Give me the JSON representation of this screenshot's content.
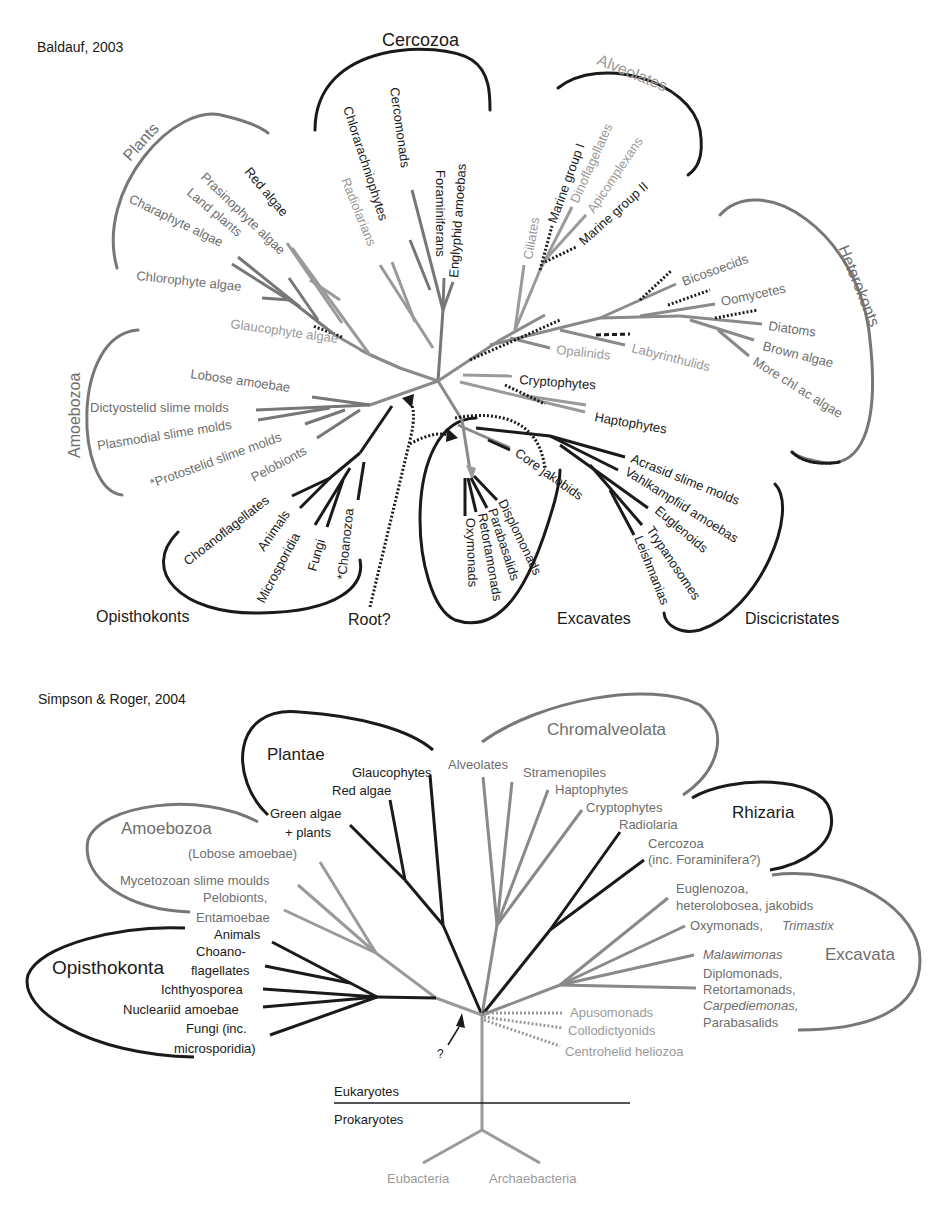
{
  "colors": {
    "dark": "#1a1a1a",
    "mid": "#6e6e6e",
    "light": "#9a9a9a"
  },
  "top_tree": {
    "title": "Baldauf, 2003",
    "groups": [
      {
        "label": "Cercozoa",
        "x": 382,
        "y": 46,
        "size": 18,
        "tone": "dark",
        "rot": 0
      },
      {
        "label": "Alveolates",
        "x": 596,
        "y": 64,
        "size": 16,
        "tone": "light",
        "rot": 22
      },
      {
        "label": "Plants",
        "x": 148,
        "y": 146,
        "size": 16,
        "tone": "mid",
        "rot": -48
      },
      {
        "label": "Heterokonts",
        "x": 846,
        "y": 280,
        "size": 16,
        "tone": "mid",
        "rot": 68
      },
      {
        "label": "Amoebozoa",
        "x": 74,
        "y": 402,
        "size": 16,
        "tone": "mid",
        "rot": -90
      },
      {
        "label": "Opisthokonts",
        "x": 96,
        "y": 622,
        "size": 16,
        "tone": "dark",
        "rot": 0
      },
      {
        "label": "Root?",
        "x": 348,
        "y": 625,
        "size": 16,
        "tone": "dark",
        "rot": 0
      },
      {
        "label": "Excavates",
        "x": 557,
        "y": 624,
        "size": 16,
        "tone": "dark",
        "rot": 0
      },
      {
        "label": "Discicristates",
        "x": 745,
        "y": 624,
        "size": 16,
        "tone": "dark",
        "rot": 0
      }
    ],
    "taxa": [
      {
        "label": "Chlorarachniophytes",
        "x": 342,
        "y": 108,
        "tone": "dark",
        "rot": 72
      },
      {
        "label": "Cercomonads",
        "x": 388,
        "y": 88,
        "tone": "dark",
        "rot": 82
      },
      {
        "label": "Foraminiferans",
        "x": 438,
        "y": 170,
        "tone": "dark",
        "rot": 90
      },
      {
        "label": "Englyphid amoebas",
        "x": 458,
        "y": 245,
        "tone": "dark",
        "rot": -90
      },
      {
        "label": "Radiolarians",
        "x": 340,
        "y": 180,
        "tone": "light",
        "rot": 70
      },
      {
        "label": "Red algae",
        "x": 244,
        "y": 170,
        "tone": "dark",
        "rot": 50
      },
      {
        "label": "Prasinophyte algae",
        "x": 200,
        "y": 176,
        "tone": "mid",
        "rot": 43
      },
      {
        "label": "Land plants",
        "x": 185,
        "y": 192,
        "tone": "mid",
        "rot": 38
      },
      {
        "label": "Charaphyte algae",
        "x": 128,
        "y": 200,
        "tone": "mid",
        "rot": 26
      },
      {
        "label": "Chlorophyte algae",
        "x": 136,
        "y": 280,
        "tone": "mid",
        "rot": 5
      },
      {
        "label": "Glaucophyte algae",
        "x": 231,
        "y": 328,
        "tone": "light",
        "rot": 8
      },
      {
        "label": "Ciliates",
        "x": 532,
        "y": 258,
        "tone": "light",
        "rot": -80
      },
      {
        "label": "Marine group I",
        "x": 558,
        "y": 224,
        "tone": "dark",
        "rot": -70
      },
      {
        "label": "Dinoflagellates",
        "x": 582,
        "y": 205,
        "tone": "light",
        "rot": -65
      },
      {
        "label": "Apicomplexans",
        "x": 594,
        "y": 215,
        "tone": "light",
        "rot": -55
      },
      {
        "label": "Marine group II",
        "x": 582,
        "y": 246,
        "tone": "dark",
        "rot": -42
      },
      {
        "label": "Bicosoecids",
        "x": 682,
        "y": 286,
        "tone": "mid",
        "rot": -20
      },
      {
        "label": "Oomycetes",
        "x": 723,
        "y": 306,
        "tone": "mid",
        "rot": -12
      },
      {
        "label": "Diatoms",
        "x": 767,
        "y": 330,
        "tone": "mid",
        "rot": 8
      },
      {
        "label": "Brown algae",
        "x": 762,
        "y": 350,
        "tone": "mid",
        "rot": 14
      },
      {
        "label": "More chl ac algae",
        "x": 752,
        "y": 364,
        "tone": "mid",
        "rot": 32
      },
      {
        "label": "Opalinids",
        "x": 556,
        "y": 354,
        "tone": "light",
        "rot": 6
      },
      {
        "label": "Labyrinthulids",
        "x": 631,
        "y": 352,
        "tone": "light",
        "rot": 14
      },
      {
        "label": "Cryptophytes",
        "x": 519,
        "y": 384,
        "tone": "dark",
        "rot": 4
      },
      {
        "label": "Haptophytes",
        "x": 594,
        "y": 421,
        "tone": "dark",
        "rot": 10
      },
      {
        "label": "Lobose amoebae",
        "x": 190,
        "y": 378,
        "tone": "mid",
        "rot": 8
      },
      {
        "label": "Dictyostelid slime molds",
        "x": 90,
        "y": 412,
        "tone": "mid",
        "rot": 0
      },
      {
        "label": "Plasmodial slime molds",
        "x": 98,
        "y": 448,
        "tone": "mid",
        "rot": -9
      },
      {
        "label": "*Protostelid slime molds",
        "x": 152,
        "y": 486,
        "tone": "mid",
        "rot": -20
      },
      {
        "label": "Pelobionts",
        "x": 252,
        "y": 480,
        "tone": "mid",
        "rot": -28
      },
      {
        "label": "Core jakobids",
        "x": 514,
        "y": 465,
        "tone": "dark",
        "rot": 35
      },
      {
        "label": "Acrasid slime molds",
        "x": 630,
        "y": 462,
        "tone": "dark",
        "rot": 22
      },
      {
        "label": "Vahlkampfiid amoebas",
        "x": 625,
        "y": 474,
        "tone": "dark",
        "rot": 32
      },
      {
        "label": "Euglenoids",
        "x": 654,
        "y": 520,
        "tone": "dark",
        "rot": 40
      },
      {
        "label": "Trypanosomes",
        "x": 647,
        "y": 530,
        "tone": "dark",
        "rot": 58
      },
      {
        "label": "Leishmanias",
        "x": 634,
        "y": 538,
        "tone": "dark",
        "rot": 68
      },
      {
        "label": "Displomonads",
        "x": 498,
        "y": 500,
        "tone": "dark",
        "rot": 64
      },
      {
        "label": "Parabasalids",
        "x": 488,
        "y": 508,
        "tone": "dark",
        "rot": 72
      },
      {
        "label": "Retortamonads",
        "x": 476,
        "y": 512,
        "tone": "dark",
        "rot": 80
      },
      {
        "label": "Oxymonads",
        "x": 463,
        "y": 516,
        "tone": "dark",
        "rot": 88
      },
      {
        "label": "Choanoflagellates",
        "x": 190,
        "y": 565,
        "tone": "dark",
        "rot": -38
      },
      {
        "label": "Animals",
        "x": 265,
        "y": 552,
        "tone": "dark",
        "rot": -55
      },
      {
        "label": "Microsporidia",
        "x": 265,
        "y": 600,
        "tone": "dark",
        "rot": -63
      },
      {
        "label": "Fungi",
        "x": 312,
        "y": 572,
        "tone": "dark",
        "rot": -74
      },
      {
        "label": "*Choanozoa",
        "x": 344,
        "y": 580,
        "tone": "dark",
        "rot": -84
      }
    ]
  },
  "bottom_tree": {
    "title": "Simpson & Roger, 2004",
    "groups": [
      {
        "label": "Plantae",
        "x": 267,
        "y": 760,
        "size": 17,
        "tone": "dark"
      },
      {
        "label": "Chromalveolata",
        "x": 547,
        "y": 735,
        "size": 17,
        "tone": "mid"
      },
      {
        "label": "Amoebozoa",
        "x": 121,
        "y": 834,
        "size": 17,
        "tone": "mid"
      },
      {
        "label": "Rhizaria",
        "x": 732,
        "y": 818,
        "size": 17,
        "tone": "dark"
      },
      {
        "label": "Excavata",
        "x": 825,
        "y": 960,
        "size": 17,
        "tone": "mid"
      },
      {
        "label": "Opisthokonta",
        "x": 52,
        "y": 974,
        "size": 19,
        "tone": "dark"
      }
    ],
    "taxa": [
      {
        "label": "Glaucophytes",
        "x": 352,
        "y": 777,
        "tone": "dark",
        "anchor": "start"
      },
      {
        "label": "Red algae",
        "x": 332,
        "y": 795,
        "tone": "dark",
        "anchor": "start"
      },
      {
        "label": "Green algae",
        "x": 270,
        "y": 818,
        "tone": "dark",
        "anchor": "start"
      },
      {
        "label": "+ plants",
        "x": 285,
        "y": 837,
        "tone": "dark",
        "anchor": "start"
      },
      {
        "label": "Alveolates",
        "x": 448,
        "y": 769,
        "tone": "mid",
        "anchor": "start"
      },
      {
        "label": "Stramenopiles",
        "x": 523,
        "y": 777,
        "tone": "mid",
        "anchor": "start"
      },
      {
        "label": "Haptophytes",
        "x": 555,
        "y": 794,
        "tone": "mid",
        "anchor": "start"
      },
      {
        "label": "Cryptophytes",
        "x": 586,
        "y": 812,
        "tone": "mid",
        "anchor": "start"
      },
      {
        "label": "Radiolaria",
        "x": 619,
        "y": 829,
        "tone": "mid",
        "anchor": "start"
      },
      {
        "label": "Cercozoa",
        "x": 648,
        "y": 848,
        "tone": "mid",
        "anchor": "start"
      },
      {
        "label": "(inc. Foraminifera?)",
        "x": 648,
        "y": 864,
        "tone": "mid",
        "anchor": "start"
      },
      {
        "label": "(Lobose amoebae)",
        "x": 188,
        "y": 858,
        "tone": "mid",
        "anchor": "start"
      },
      {
        "label": "Mycetozoan slime moulds",
        "x": 120,
        "y": 885,
        "tone": "mid",
        "anchor": "start"
      },
      {
        "label": "Pelobionts,",
        "x": 203,
        "y": 902,
        "tone": "mid",
        "anchor": "start"
      },
      {
        "label": "Entamoebae",
        "x": 196,
        "y": 922,
        "tone": "mid",
        "anchor": "start"
      },
      {
        "label": "Animals",
        "x": 214,
        "y": 939,
        "tone": "dark",
        "anchor": "start"
      },
      {
        "label": "Choano-",
        "x": 196,
        "y": 956,
        "tone": "dark",
        "anchor": "start"
      },
      {
        "label": "flagellates",
        "x": 191,
        "y": 975,
        "tone": "dark",
        "anchor": "start"
      },
      {
        "label": "Ichthyosporea",
        "x": 161,
        "y": 994,
        "tone": "dark",
        "anchor": "start"
      },
      {
        "label": "Nucleariid amoebae",
        "x": 123,
        "y": 1014,
        "tone": "dark",
        "anchor": "start"
      },
      {
        "label": "Fungi (inc.",
        "x": 186,
        "y": 1033,
        "tone": "dark",
        "anchor": "start"
      },
      {
        "label": "microsporidia)",
        "x": 174,
        "y": 1053,
        "tone": "dark",
        "anchor": "start"
      },
      {
        "label": "Euglenozoa,",
        "x": 676,
        "y": 893,
        "tone": "mid",
        "anchor": "start"
      },
      {
        "label": "heterolobosea, jakobids",
        "x": 676,
        "y": 910,
        "tone": "mid",
        "anchor": "start"
      },
      {
        "label": "Oxymonads, ",
        "x": 690,
        "y": 930,
        "tone": "mid",
        "anchor": "start"
      },
      {
        "label": "Trimastix",
        "x": 782,
        "y": 930,
        "tone": "mid",
        "anchor": "start",
        "italic": true
      },
      {
        "label": "Malawimonas",
        "x": 703,
        "y": 959,
        "tone": "mid",
        "anchor": "start",
        "italic": true
      },
      {
        "label": "Diplomonads,",
        "x": 703,
        "y": 978,
        "tone": "mid",
        "anchor": "start"
      },
      {
        "label": "Retortamonads,",
        "x": 703,
        "y": 994,
        "tone": "mid",
        "anchor": "start"
      },
      {
        "label": "Carpediemonas,",
        "x": 703,
        "y": 1010,
        "tone": "mid",
        "anchor": "start",
        "italic": true
      },
      {
        "label": "Parabasalids",
        "x": 703,
        "y": 1027,
        "tone": "mid",
        "anchor": "start"
      },
      {
        "label": "Apusomonads",
        "x": 570,
        "y": 1017,
        "tone": "light",
        "anchor": "start"
      },
      {
        "label": "Collodictyonids",
        "x": 568,
        "y": 1035,
        "tone": "light",
        "anchor": "start"
      },
      {
        "label": "Centrohelid heliozoa",
        "x": 565,
        "y": 1056,
        "tone": "light",
        "anchor": "start"
      },
      {
        "label": "?",
        "x": 437,
        "y": 1058,
        "tone": "dark",
        "anchor": "start"
      },
      {
        "label": "Eukaryotes",
        "x": 334,
        "y": 1096,
        "tone": "dark",
        "anchor": "start"
      },
      {
        "label": "Prokaryotes",
        "x": 334,
        "y": 1124,
        "tone": "dark",
        "anchor": "start"
      },
      {
        "label": "Eubacteria",
        "x": 387,
        "y": 1183,
        "tone": "light",
        "anchor": "start"
      },
      {
        "label": "Archaebacteria",
        "x": 489,
        "y": 1183,
        "tone": "light",
        "anchor": "start"
      }
    ]
  }
}
